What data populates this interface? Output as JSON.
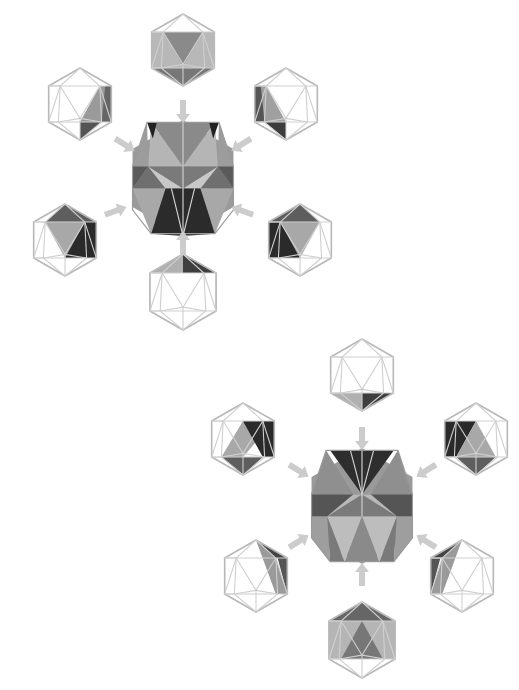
{
  "diagram": {
    "colors": {
      "background": "#ffffff",
      "wire": "#b8b8b8",
      "arrow": "#cccccc",
      "shade_light": "#b3b3b3",
      "shade_mid": "#8c8c8c",
      "shade_dark": "#5e5e5e",
      "shade_darkest": "#2f2f2f"
    },
    "clusters": [
      {
        "name": "cluster-top",
        "center": {
          "x": 183,
          "y": 178,
          "r": 58
        },
        "satellites": [
          {
            "name": "top",
            "x": 183,
            "y": 50,
            "r": 36
          },
          {
            "name": "upper-left",
            "x": 80,
            "y": 104,
            "r": 36
          },
          {
            "name": "upper-right",
            "x": 286,
            "y": 104,
            "r": 36
          },
          {
            "name": "lower-left",
            "x": 65,
            "y": 240,
            "r": 36
          },
          {
            "name": "lower-right",
            "x": 300,
            "y": 240,
            "r": 36
          },
          {
            "name": "bottom",
            "x": 183,
            "y": 292,
            "r": 38
          }
        ]
      },
      {
        "name": "cluster-bottom",
        "center": {
          "x": 362,
          "y": 506,
          "r": 58
        },
        "satellites": [
          {
            "name": "top",
            "x": 362,
            "y": 375,
            "r": 36
          },
          {
            "name": "upper-left",
            "x": 243,
            "y": 439,
            "r": 36
          },
          {
            "name": "upper-right",
            "x": 476,
            "y": 439,
            "r": 36
          },
          {
            "name": "lower-left",
            "x": 256,
            "y": 576,
            "r": 36
          },
          {
            "name": "lower-right",
            "x": 462,
            "y": 576,
            "r": 36
          },
          {
            "name": "bottom",
            "x": 362,
            "y": 640,
            "r": 38
          }
        ]
      }
    ]
  }
}
